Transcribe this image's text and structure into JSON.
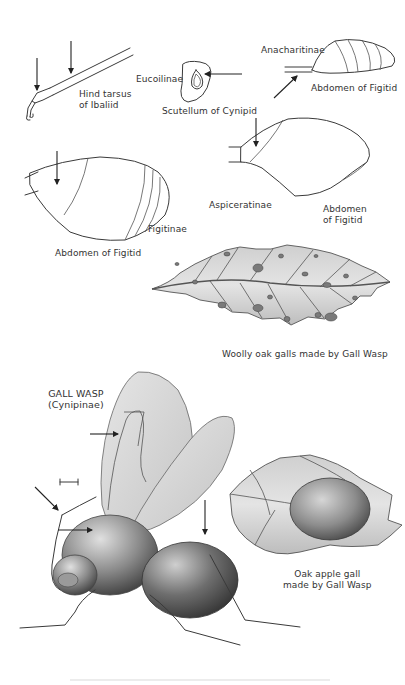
{
  "plate": {
    "title": "Gall Wasps (Cynipoidea) — identification plate",
    "figures": [
      {
        "id": "hind-tarsus",
        "label_lines": [
          "Hind tarsus",
          "of Ibaliid"
        ]
      },
      {
        "id": "scutellum",
        "label": "Scutellum of Cynipid",
        "subfamily": "Eucoilinae"
      },
      {
        "id": "abdomen-anacharitinae",
        "label": "Abdomen of Figitid",
        "subfamily": "Anacharitinae"
      },
      {
        "id": "abdomen-figitinae",
        "label": "Abdomen of Figitid",
        "subfamily": "Figitinae"
      },
      {
        "id": "abdomen-aspiceratinae",
        "label_lines": [
          "Abdomen",
          "of Figitid"
        ],
        "subfamily": "Aspiceratinae"
      },
      {
        "id": "woolly-oak-galls",
        "label": "Woolly oak galls made by Gall Wasp"
      },
      {
        "id": "gall-wasp",
        "label_lines": [
          "GALL WASP",
          "(Cynipinae)"
        ]
      },
      {
        "id": "oak-apple-gall",
        "label_lines": [
          "Oak apple gall",
          "made by Gall Wasp"
        ]
      }
    ]
  },
  "colors": {
    "background": "#ffffff",
    "ink": "#333333",
    "leaf_shade": "#b8b8b8",
    "gall_dark": "#5a5a5a"
  }
}
